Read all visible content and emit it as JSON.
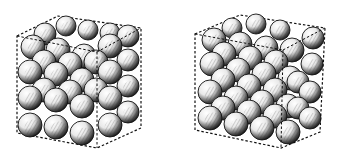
{
  "figure": {
    "panels": [
      {
        "id": "left",
        "label": "",
        "box": {
          "back": [
            [
              17,
              36
            ],
            [
              58,
              16
            ],
            [
              141,
              28
            ],
            [
              141,
              128
            ],
            [
              97,
              148
            ],
            [
              17,
              133
            ]
          ],
          "front_edges": [
            [
              [
                17,
                36
              ],
              [
                97,
                52
              ]
            ],
            [
              [
                97,
                52
              ],
              [
                141,
                28
              ]
            ],
            [
              [
                97,
                52
              ],
              [
                97,
                148
              ]
            ]
          ]
        },
        "spheres": [
          [
            30,
            125,
            12
          ],
          [
            56,
            127,
            12
          ],
          [
            82,
            133,
            12
          ],
          [
            110,
            125,
            12
          ],
          [
            128,
            112,
            11
          ],
          [
            30,
            98,
            12
          ],
          [
            56,
            100,
            12
          ],
          [
            82,
            106,
            12
          ],
          [
            110,
            98,
            12
          ],
          [
            128,
            86,
            11
          ],
          [
            30,
            72,
            12
          ],
          [
            56,
            74,
            12
          ],
          [
            82,
            80,
            12
          ],
          [
            110,
            72,
            12
          ],
          [
            128,
            60,
            11
          ],
          [
            33,
            47,
            12
          ],
          [
            58,
            50,
            12
          ],
          [
            84,
            56,
            12
          ],
          [
            110,
            46,
            12
          ],
          [
            128,
            36,
            11
          ],
          [
            44,
            90,
            12
          ],
          [
            70,
            92,
            12
          ],
          [
            96,
            90,
            12
          ],
          [
            44,
            62,
            12
          ],
          [
            70,
            64,
            12
          ],
          [
            96,
            62,
            12
          ],
          [
            45,
            34,
            11
          ],
          [
            66,
            26,
            10
          ],
          [
            88,
            30,
            10
          ],
          [
            110,
            33,
            10
          ]
        ]
      },
      {
        "id": "right",
        "label": "",
        "box": {
          "back": [
            [
              195,
              34
            ],
            [
              240,
              15
            ],
            [
              325,
              28
            ],
            [
              320,
              132
            ],
            [
              281,
              148
            ],
            [
              195,
              130
            ]
          ],
          "front_edges": [
            [
              [
                195,
                34
              ],
              [
                283,
                50
              ]
            ],
            [
              [
                283,
                50
              ],
              [
                325,
                28
              ]
            ],
            [
              [
                283,
                50
              ],
              [
                281,
                148
              ]
            ]
          ]
        },
        "spheres": [
          [
            210,
            118,
            12
          ],
          [
            236,
            124,
            12
          ],
          [
            262,
            128,
            12
          ],
          [
            288,
            132,
            12
          ],
          [
            310,
            118,
            11
          ],
          [
            210,
            92,
            12
          ],
          [
            236,
            98,
            12
          ],
          [
            262,
            102,
            12
          ],
          [
            288,
            106,
            12
          ],
          [
            310,
            92,
            11
          ],
          [
            212,
            64,
            12
          ],
          [
            238,
            70,
            12
          ],
          [
            264,
            74,
            12
          ],
          [
            290,
            78,
            12
          ],
          [
            312,
            64,
            11
          ],
          [
            214,
            40,
            12
          ],
          [
            240,
            44,
            12
          ],
          [
            266,
            48,
            12
          ],
          [
            292,
            50,
            12
          ],
          [
            313,
            38,
            11
          ],
          [
            223,
            108,
            12
          ],
          [
            249,
            112,
            12
          ],
          [
            275,
            116,
            12
          ],
          [
            223,
            80,
            12
          ],
          [
            249,
            86,
            12
          ],
          [
            275,
            90,
            12
          ],
          [
            224,
            54,
            12
          ],
          [
            250,
            58,
            12
          ],
          [
            276,
            62,
            12
          ],
          [
            298,
            82,
            11
          ],
          [
            298,
            108,
            11
          ],
          [
            232,
            28,
            10
          ],
          [
            256,
            24,
            10
          ],
          [
            280,
            30,
            10
          ]
        ]
      }
    ],
    "colors": {
      "ink": "#111111",
      "paper": "#ffffff",
      "shade": "#555555"
    }
  }
}
